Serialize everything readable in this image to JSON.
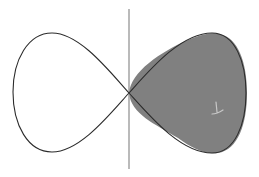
{
  "diagram": {
    "description": "Figure-eight (lemniscate-like) curve crossing a vertical axis; right lobe shaded",
    "colors": {
      "background": "#ffffff",
      "curve_stroke": "#2b2b2b",
      "axis_stroke": "#8c8c8c",
      "shaded_fill": "#808080",
      "highlight": "#c8c8c8"
    },
    "axis": {
      "x": 129,
      "y_top": 9,
      "y_bottom": 169
    },
    "crossing_point": {
      "x": 129,
      "y": 93
    },
    "left_lobe": {
      "leftmost_x": 13,
      "top_y": 33,
      "bottom_y": 152
    },
    "right_lobe": {
      "rightmost_x": 246,
      "top_y": 33,
      "bottom_y": 153,
      "shaded": true
    }
  }
}
